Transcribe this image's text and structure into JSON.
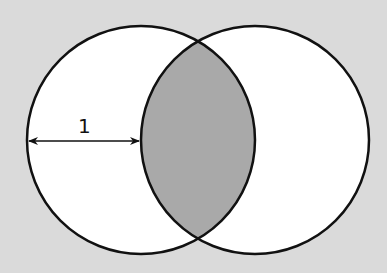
{
  "diagram": {
    "type": "venn-lens",
    "radius_label": "1",
    "colors": {
      "background": "#dadada",
      "circle_fill": "#ffffff",
      "intersection_fill": "#a9a9a9",
      "stroke": "#111111"
    },
    "circles": [
      {
        "name": "left-circle",
        "cx": 141,
        "cy": 140,
        "r": 114
      },
      {
        "name": "right-circle",
        "cx": 255,
        "cy": 140,
        "r": 114
      }
    ],
    "radius_arrow": {
      "x1": 27,
      "x2": 141,
      "y": 141
    }
  }
}
